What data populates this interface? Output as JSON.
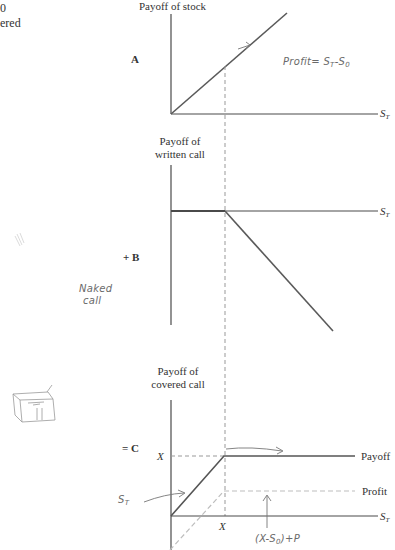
{
  "page": {
    "cut_text_top_left": [
      "0",
      "ered"
    ]
  },
  "panel_a": {
    "title": "Payoff of stock",
    "letter": "A",
    "x_axis": "S",
    "x_axis_sub": "T",
    "annotation": "Profit= S",
    "annotation_sub1": "T",
    "annotation_tail": "-S",
    "annotation_sub2": "0"
  },
  "panel_b": {
    "title_line1": "Payoff of",
    "title_line2": "written call",
    "letter": "+ B",
    "x_axis": "S",
    "x_axis_sub": "T",
    "annotation_line1": "Naked",
    "annotation_line2": "call"
  },
  "panel_c": {
    "title_line1": "Payoff of",
    "title_line2": "covered call",
    "letter": "= C",
    "y_tick": "X",
    "x_tick": "X",
    "x_axis": "S",
    "x_axis_sub": "T",
    "payoff_label": "Payoff",
    "profit_label": "Profit",
    "annotation_st": "S",
    "annotation_st_sub": "T",
    "annotation_bottom": "(X-S",
    "annotation_bottom_sub": "0",
    "annotation_bottom_tail": ")+P"
  },
  "colors": {
    "ink": "#555555",
    "axis": "#4a4a4a",
    "dashed": "#999999",
    "profit_dashed": "#bdbdbd",
    "handwriting": "#6a6a6a"
  }
}
